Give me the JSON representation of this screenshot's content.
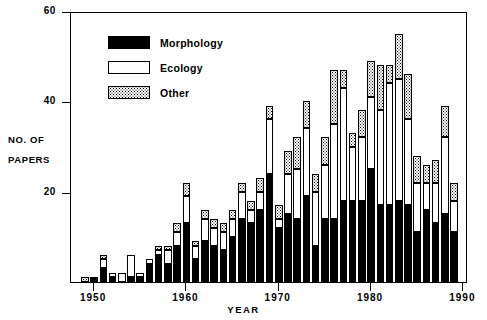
{
  "chart_data": {
    "type": "bar",
    "stacked": true,
    "title": "",
    "xlabel": "YEAR",
    "ylabel": "NO. OF PAPERS",
    "ylabel_lines": [
      "NO. OF",
      "PAPERS"
    ],
    "xlim": [
      1947.5,
      1990.5
    ],
    "ylim": [
      0,
      60
    ],
    "yticks": [
      20,
      40,
      60
    ],
    "ytick_labels": [
      "20",
      "40",
      "60"
    ],
    "xticks": [
      1950,
      1960,
      1970,
      1980,
      1990
    ],
    "xtick_labels": [
      "1950",
      "1960",
      "1970",
      "1980",
      "1990"
    ],
    "grid": false,
    "legend_position": "upper-left-inside",
    "categories": [
      1948,
      1949,
      1950,
      1951,
      1952,
      1953,
      1954,
      1955,
      1956,
      1957,
      1958,
      1959,
      1960,
      1961,
      1962,
      1963,
      1964,
      1965,
      1966,
      1967,
      1968,
      1969,
      1970,
      1971,
      1972,
      1973,
      1974,
      1975,
      1976,
      1977,
      1978,
      1979,
      1980,
      1981,
      1982,
      1983,
      1984,
      1985,
      1986,
      1987,
      1988,
      1989
    ],
    "series": [
      {
        "name": "Morphology",
        "color": "#000000",
        "fill": "solid",
        "values": [
          0,
          0,
          1,
          3,
          1,
          0,
          1,
          1,
          4,
          6,
          4,
          8,
          13,
          5,
          9,
          8,
          7,
          10,
          14,
          13,
          16,
          24,
          12,
          15,
          14,
          19,
          8,
          14,
          14,
          18,
          18,
          18,
          25,
          17,
          17,
          18,
          17,
          11,
          16,
          13,
          15,
          11
        ]
      },
      {
        "name": "Ecology",
        "color": "#ffffff",
        "fill": "open",
        "values": [
          0,
          0,
          0,
          2,
          1,
          2,
          5,
          1,
          1,
          1,
          3,
          3,
          6,
          3,
          5,
          4,
          4,
          4,
          6,
          3,
          4,
          12,
          2,
          9,
          11,
          15,
          12,
          12,
          21,
          25,
          12,
          14,
          16,
          21,
          27,
          27,
          19,
          11,
          6,
          9,
          17,
          7
        ]
      },
      {
        "name": "Other",
        "color": "#ffffff",
        "fill": "stipple",
        "values": [
          0,
          1,
          0,
          1,
          0,
          0,
          0,
          0,
          0,
          1,
          1,
          2,
          3,
          1,
          2,
          2,
          2,
          2,
          2,
          2,
          3,
          3,
          3,
          5,
          7,
          6,
          4,
          6,
          12,
          4,
          3,
          6,
          8,
          10,
          4,
          10,
          10,
          6,
          4,
          5,
          7,
          4
        ]
      }
    ],
    "totals": [
      0,
      1,
      1,
      6,
      2,
      2,
      6,
      2,
      5,
      8,
      8,
      13,
      22,
      9,
      16,
      14,
      13,
      16,
      22,
      18,
      23,
      39,
      17,
      29,
      32,
      40,
      24,
      32,
      47,
      47,
      33,
      38,
      49,
      48,
      48,
      55,
      46,
      28,
      26,
      27,
      39,
      22
    ],
    "legend": [
      {
        "label": "Morphology",
        "swatch": "solid-black"
      },
      {
        "label": "Ecology",
        "swatch": "open-white"
      },
      {
        "label": "Other",
        "swatch": "stippled"
      }
    ]
  }
}
